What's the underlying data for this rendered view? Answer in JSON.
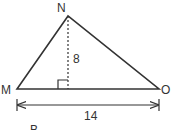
{
  "diagram": {
    "type": "triangle with altitude",
    "vertices": {
      "top": "N",
      "left": "M",
      "right": "O"
    },
    "altitude_label": "8",
    "base_label": "14",
    "caption": "B",
    "colors": {
      "stroke": "#333333",
      "background": "#ffffff"
    }
  }
}
